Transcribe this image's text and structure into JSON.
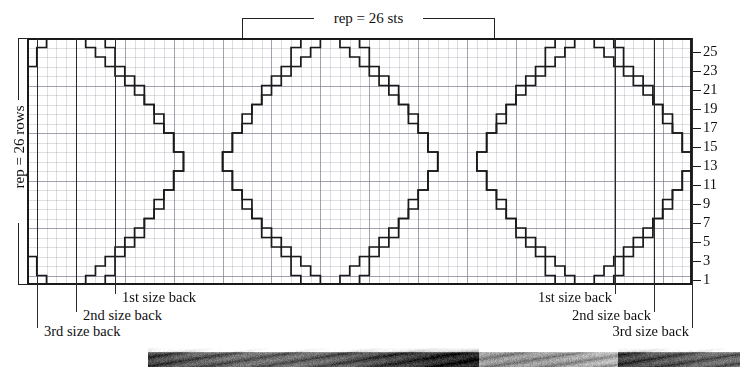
{
  "chart_data": {
    "type": "heatmap",
    "subtitle": "",
    "xlabel": "stitches",
    "ylabel": "rows",
    "grid": true,
    "legend_position": "none",
    "columns": 68,
    "rows": 26,
    "cell_width_px": 9.78,
    "cell_height_px": 9.5,
    "row_number_labels": [
      1,
      3,
      5,
      7,
      9,
      11,
      13,
      15,
      17,
      19,
      21,
      23,
      25
    ],
    "row_numbers_side": "right",
    "repeat_stitches": 26,
    "repeat_rows": 26,
    "motif_period_columns": 26,
    "motif_count_visible": 3,
    "outline_color": "#1a1a1a",
    "grid_color": "#c8c8d0",
    "background_color": "#ffffff",
    "x_range": [
      0,
      68
    ],
    "y_range": [
      0,
      26
    ],
    "motif_outline_normalized": [
      [
        0.0,
        0.0
      ],
      [
        0.08,
        0.0
      ],
      [
        0.08,
        0.04
      ],
      [
        0.0,
        0.04
      ]
    ]
  },
  "brackets": {
    "top": {
      "label": "rep = 26 sts",
      "start_col": 22,
      "end_col": 48
    },
    "left": {
      "label": "rep = 26 rows",
      "start_row": 1,
      "end_row": 26
    }
  },
  "row_ticks": [
    {
      "label": "25",
      "row": 25
    },
    {
      "label": "23",
      "row": 23
    },
    {
      "label": "21",
      "row": 21
    },
    {
      "label": "19",
      "row": 19
    },
    {
      "label": "17",
      "row": 17
    },
    {
      "label": "15",
      "row": 15
    },
    {
      "label": "13",
      "row": 13
    },
    {
      "label": "11",
      "row": 11
    },
    {
      "label": "9",
      "row": 9
    },
    {
      "label": "7",
      "row": 7
    },
    {
      "label": "5",
      "row": 5
    },
    {
      "label": "3",
      "row": 3
    },
    {
      "label": "1",
      "row": 1
    }
  ],
  "size_markers": {
    "left": [
      {
        "label": "3rd size back",
        "x": 37
      },
      {
        "label": "2nd size back",
        "x": 76
      },
      {
        "label": "1st size back",
        "x": 115
      }
    ],
    "right": [
      {
        "label": "1st size back",
        "x": 615
      },
      {
        "label": "2nd size back",
        "x": 654
      },
      {
        "label": "3rd size back",
        "x": 692
      }
    ]
  },
  "photo_strip": {
    "present": true,
    "description": "dark monochrome photograph band cropped at the bottom edge"
  }
}
